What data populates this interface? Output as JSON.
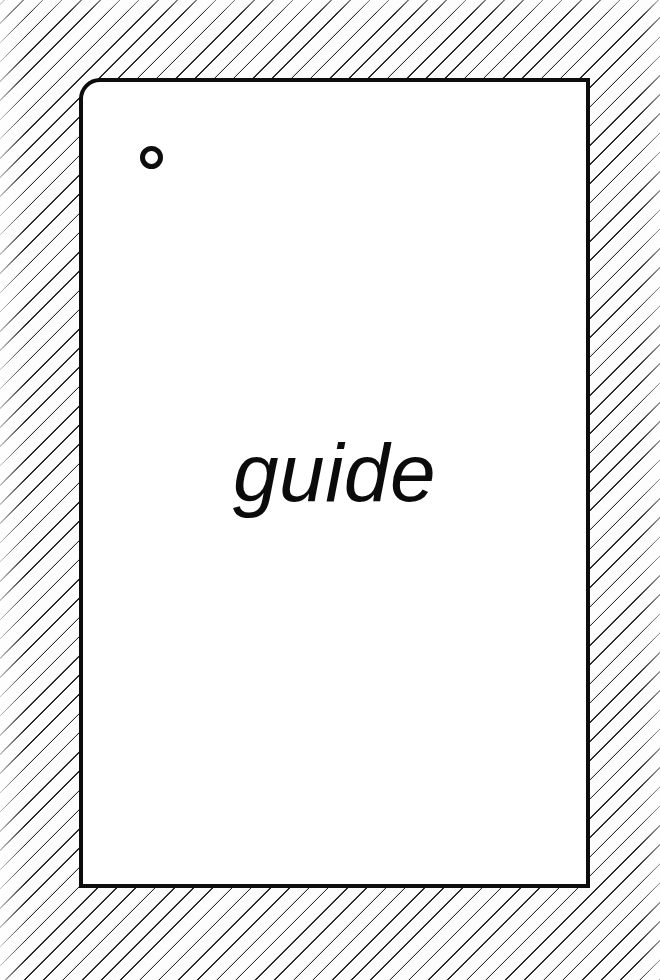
{
  "page": {
    "width": 660,
    "height": 980,
    "background_color": "#fdfdfd",
    "hatch_line_color": "#2a2a2a"
  },
  "backdrop": {
    "pattern_name": "diagonal-hatch",
    "angle_label": "-45deg"
  },
  "card": {
    "background_color": "#ffffff",
    "border_color": "#0d0d0d",
    "caption": "guide",
    "hole": {
      "icon_name": "circle-outline",
      "color": "#0d0d0d"
    }
  }
}
